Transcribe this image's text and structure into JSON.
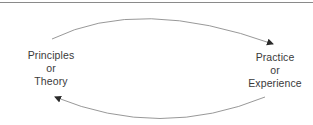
{
  "diagram": {
    "type": "cycle",
    "nodes": [
      {
        "id": "left",
        "lines": [
          "Principles",
          "or",
          "Theory"
        ]
      },
      {
        "id": "right",
        "lines": [
          "Practice",
          "or",
          "Experience"
        ]
      }
    ],
    "edges": [
      {
        "from": "left",
        "to": "right",
        "position": "top",
        "style": "curved-arrow"
      },
      {
        "from": "right",
        "to": "left",
        "position": "bottom",
        "style": "curved-arrow"
      }
    ],
    "colors": {
      "line": "#8c8c8c",
      "arrowhead": "#2a2a2a",
      "text": "#3a3a3a",
      "rule": "#8a8a8a"
    }
  }
}
